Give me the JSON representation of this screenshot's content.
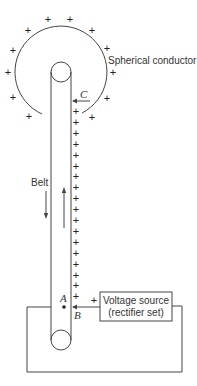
{
  "diagram": {
    "labels": {
      "sphere": "Spherical conductor",
      "belt": "Belt",
      "voltage_source_line1": "Voltage source",
      "voltage_source_line2": "(rectifier set)",
      "point_a": "A",
      "point_b": "B",
      "point_c": "C",
      "source_plus": "+"
    },
    "charge_symbol": "+",
    "sphere_charges": [
      {
        "x": 48,
        "y": 19
      },
      {
        "x": 70,
        "y": 19
      },
      {
        "x": 28,
        "y": 30
      },
      {
        "x": 92,
        "y": 30
      },
      {
        "x": 13,
        "y": 50
      },
      {
        "x": 107,
        "y": 48
      },
      {
        "x": 8,
        "y": 72
      },
      {
        "x": 113,
        "y": 72
      },
      {
        "x": 13,
        "y": 97
      },
      {
        "x": 107,
        "y": 98
      },
      {
        "x": 29,
        "y": 116
      },
      {
        "x": 92,
        "y": 117
      }
    ],
    "belt_charge_count": 18,
    "colors": {
      "line": "#444444",
      "text": "#333333",
      "background": "#ffffff"
    }
  }
}
